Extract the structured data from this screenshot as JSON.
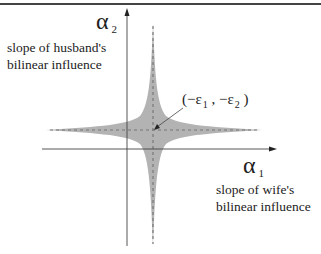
{
  "diagram": {
    "y_axis": {
      "symbol": "α",
      "subscript": "2",
      "description_line1": "slope of husband's",
      "description_line2": "bilinear influence"
    },
    "x_axis": {
      "symbol": "α",
      "subscript": "1",
      "description_line1": "slope of wife's",
      "description_line2": "bilinear influence"
    },
    "point_label": {
      "open": "(−ε",
      "sub1": "1",
      "mid": " , −ε",
      "sub2": "2",
      "close": " )"
    },
    "colors": {
      "region_fill": "#b3b3b3",
      "axis": "#333333",
      "dashed": "#777777",
      "text": "#222222"
    }
  }
}
